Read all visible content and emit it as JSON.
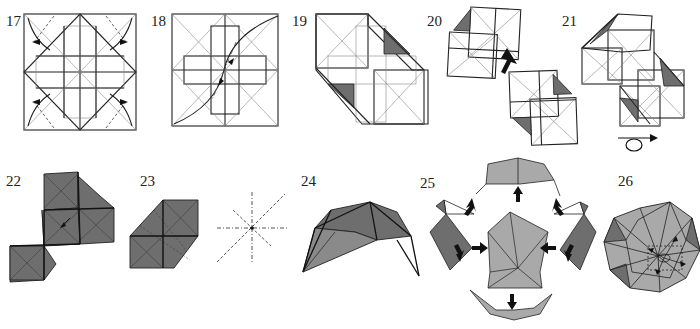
{
  "sheet": {
    "type": "origami folding instructions",
    "colors": {
      "paper_white": "#ffffff",
      "paper_colored_dark": "#6e6e6e",
      "paper_colored_light": "#a9a9a9",
      "line": "#222222",
      "crease": "#888888"
    }
  },
  "steps": [
    {
      "number": "17",
      "description": "Square crease pattern with cross-shaped center; four curved arrows pointing outward at corners (open flaps)",
      "icons": [
        "arrow-out-left",
        "arrow-out-right",
        "arrow-out-left",
        "arrow-out-right"
      ]
    },
    {
      "number": "18",
      "description": "Square crease pattern; diagonal dash-dot line with two arrowheads meeting at center; curved edges at top-right and bottom-left",
      "icons": [
        "fold-arrow",
        "fold-arrow"
      ]
    },
    {
      "number": "19",
      "description": "Diagonal folded shape with two dark shaded triangles",
      "icons": []
    },
    {
      "number": "20",
      "description": "Two units; large black arrow indicating insert one into the other",
      "icons": [
        "insert-arrow"
      ]
    },
    {
      "number": "21",
      "description": "Joined units in diagonal strip; turn-over symbol below",
      "icons": [
        "turn-over-icon"
      ]
    },
    {
      "number": "22",
      "description": "Colored side; three-square shape with small arrow at center",
      "icons": [
        "small-arrow"
      ]
    },
    {
      "number": "23",
      "description": "Colored hexagonal unit with dashed creases",
      "icons": []
    },
    {
      "number": "24",
      "description": "Completed unit in 3D (pyramid cap with legs)",
      "icons": []
    },
    {
      "number": "25",
      "description": "Assembly: center unit with four units around, black arrows pointing inward",
      "icons": [
        "assembly-arrow",
        "assembly-arrow",
        "assembly-arrow",
        "assembly-arrow",
        "assembly-arrow",
        "assembly-arrow",
        "assembly-arrow",
        "assembly-arrow"
      ]
    },
    {
      "number": "26",
      "description": "Finished modular polyhedron with dashed arrows showing final locking",
      "icons": [
        "lock-arrows"
      ]
    }
  ],
  "crease_symbols": {
    "step_between_23_24": "dash-dot star crease diagram (valley/mountain lines)"
  }
}
